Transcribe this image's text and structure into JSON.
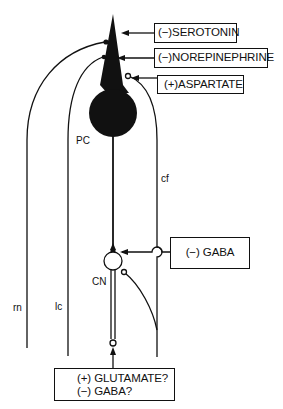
{
  "diagram": {
    "type": "cerebellar circuit neurotransmitter schematic",
    "neurons": {
      "purkinje_cell": "PC",
      "cerebellar_nucleus": "CN"
    },
    "afferents": {
      "raphe": "rn",
      "locus_coeruleus": "lc",
      "climbing_fiber": "cf"
    },
    "boxes": {
      "serotonin": "(−)SEROTONIN",
      "norepinephrine": "(−)NOREPINEPHRINE",
      "aspartate": "(+)ASPARTATE",
      "gaba": "(−) GABA",
      "output_line1": "(+) GLUTAMATE?",
      "output_line2": "(−) GABA?"
    },
    "colors": {
      "ink": "#111111",
      "background": "#ffffff"
    }
  }
}
